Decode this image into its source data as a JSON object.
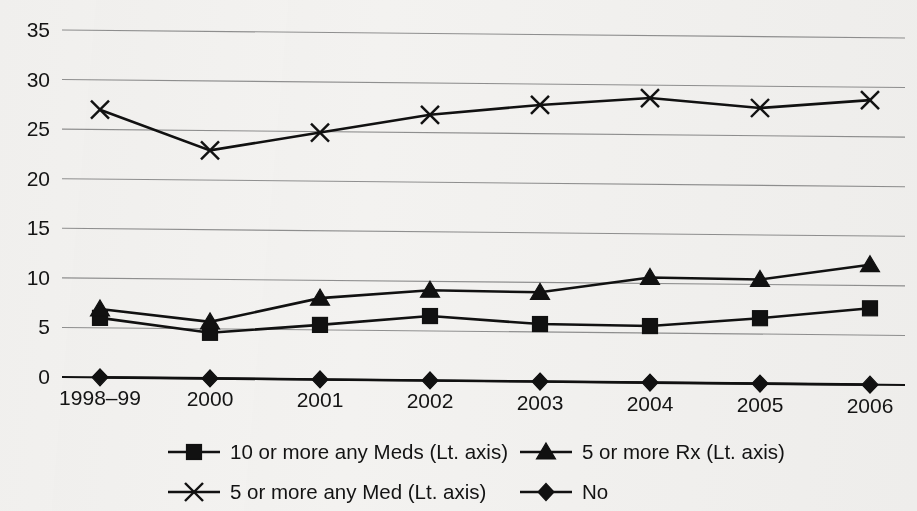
{
  "chart_data": {
    "type": "line",
    "title": "",
    "subtitle": "",
    "xlabel": "",
    "ylabel": "",
    "categories": [
      "1998–99",
      "2000",
      "2001",
      "2002",
      "2003",
      "2004",
      "2005",
      "2006"
    ],
    "ylim": [
      0,
      35
    ],
    "ytick_values": [
      0,
      5,
      10,
      15,
      20,
      25,
      30,
      35
    ],
    "ytick_labels": [
      "0",
      "5",
      "10",
      "15",
      "20",
      "25",
      "30",
      "35"
    ],
    "grid": true,
    "legend_position": "bottom",
    "series": [
      {
        "name": "10 or more any Meds (Lt. axis)",
        "marker": "square",
        "values": [
          6.0,
          4.6,
          5.5,
          6.5,
          5.8,
          5.7,
          6.6,
          7.7
        ]
      },
      {
        "name": "5 or more Rx (Lt. axis)",
        "marker": "triangle",
        "values": [
          6.9,
          5.7,
          8.2,
          9.1,
          9.0,
          10.6,
          10.5,
          12.1
        ]
      },
      {
        "name": "5 or more any Med (Lt. axis)",
        "marker": "cross-x",
        "values": [
          27.0,
          23.0,
          24.9,
          26.8,
          27.9,
          28.7,
          27.8,
          28.7
        ]
      },
      {
        "name": "No",
        "marker": "diamond",
        "values": [
          0,
          0,
          0,
          0,
          0,
          0,
          0,
          0
        ]
      }
    ]
  },
  "legend": {
    "entries": [
      {
        "label": "10 or more any Meds (Lt. axis)",
        "marker": "square"
      },
      {
        "label": "5 or more Rx (Lt. axis)",
        "marker": "triangle"
      },
      {
        "label": "5 or more any Med (Lt. axis)",
        "marker": "cross-x"
      },
      {
        "label": "No",
        "marker": "diamond"
      }
    ]
  },
  "colors": {
    "ink": "#111111",
    "grid": "#8f8f8f",
    "background": "#f3f2f0"
  }
}
